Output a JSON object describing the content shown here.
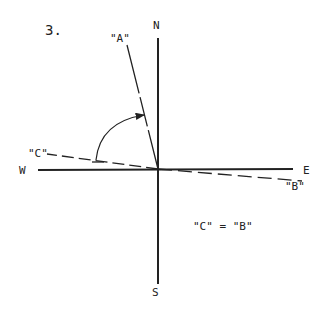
{
  "figure": {
    "number": "3.",
    "compass": {
      "north": "N",
      "south": "S",
      "east": "E",
      "west": "W"
    },
    "bearings": [
      {
        "id": "A",
        "label": "\"A\""
      },
      {
        "id": "B",
        "label": "\"B\""
      },
      {
        "id": "C",
        "label": "\"C\""
      }
    ],
    "equation": "\"C\" = \"B\""
  },
  "colors": {
    "ink": "#222222",
    "background": "#ffffff"
  }
}
